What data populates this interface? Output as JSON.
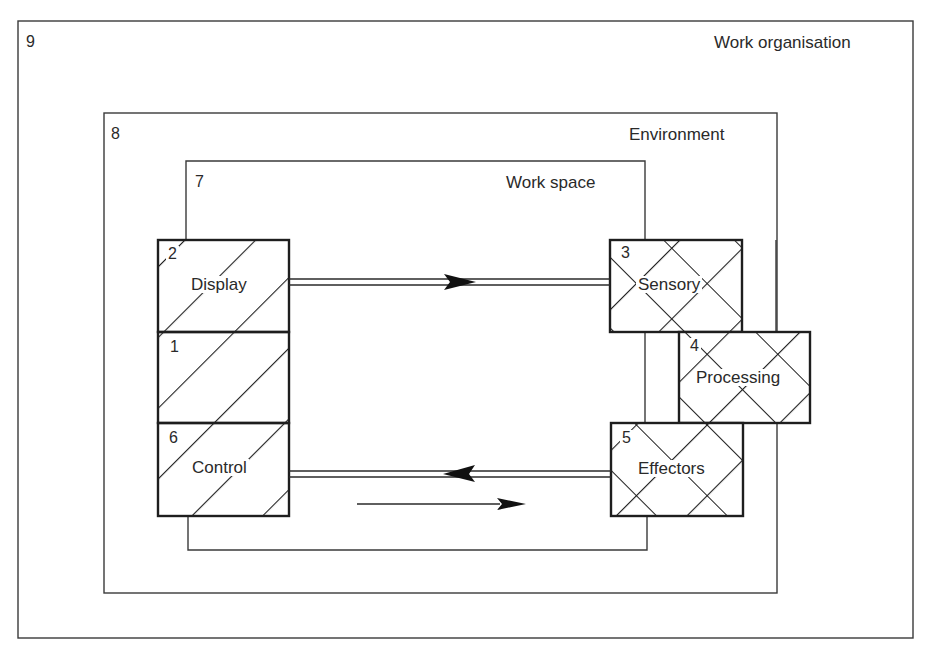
{
  "diagram": {
    "colors": {
      "line": "#1e1e1e",
      "frame": "#3a3a3a",
      "text": "#2a2a2a",
      "background": "#ffffff"
    },
    "frames": [
      {
        "id": "work-organisation",
        "number": "9",
        "label": "Work organisation"
      },
      {
        "id": "environment",
        "number": "8",
        "label": "Environment"
      },
      {
        "id": "work-space",
        "number": "7",
        "label": "Work space"
      }
    ],
    "boxes": [
      {
        "id": "display",
        "number": "2",
        "label": "Display",
        "pattern": "single-hatch"
      },
      {
        "id": "human-machine",
        "number": "1",
        "label": "",
        "pattern": "single-hatch"
      },
      {
        "id": "control",
        "number": "6",
        "label": "Control",
        "pattern": "single-hatch"
      },
      {
        "id": "sensory",
        "number": "3",
        "label": "Sensory",
        "pattern": "cross-hatch"
      },
      {
        "id": "processing",
        "number": "4",
        "label": "Processing",
        "pattern": "cross-hatch"
      },
      {
        "id": "effectors",
        "number": "5",
        "label": "Effectors",
        "pattern": "cross-hatch"
      }
    ],
    "connections": [
      {
        "from": "display",
        "to": "sensory",
        "style": "double-line",
        "direction": "right"
      },
      {
        "from": "effectors",
        "to": "control",
        "style": "double-line",
        "direction": "left"
      },
      {
        "from": "control",
        "to": "effectors",
        "style": "single-line",
        "direction": "right"
      }
    ]
  }
}
